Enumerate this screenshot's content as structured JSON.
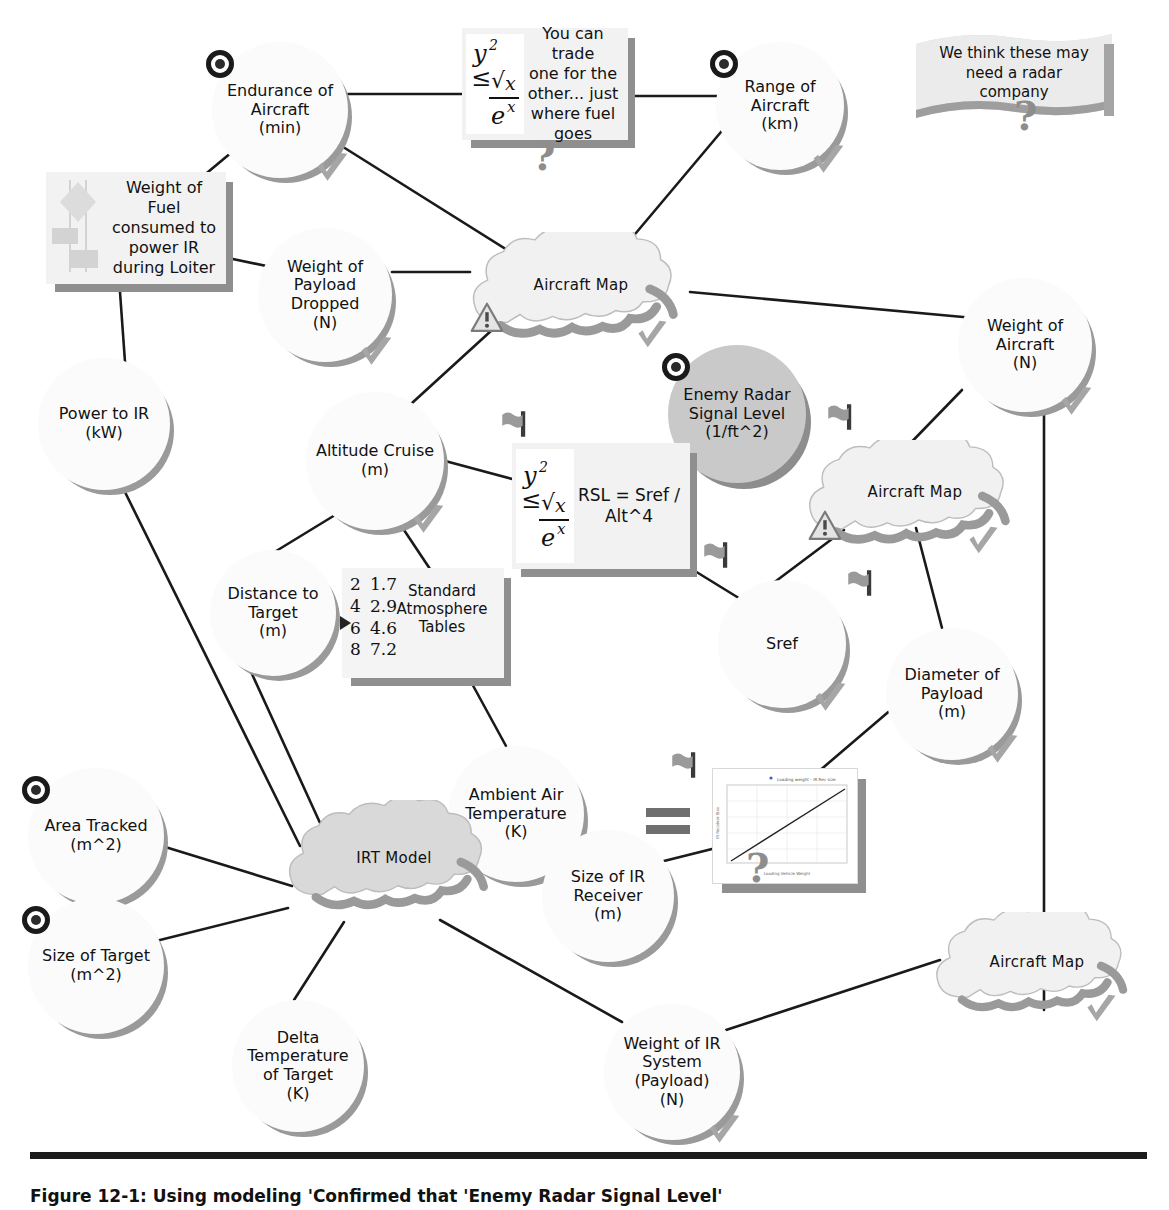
{
  "diagram": {
    "colors": {
      "node_fill": "#fbfbfb",
      "node_shadow": "#9a9a9a",
      "cloud_fill_light": "#f0f0f0",
      "cloud_fill_gray": "#d9d9d9",
      "note_fill": "#f2f2f2",
      "ink": "#111111",
      "edge": "#1a1a1a"
    },
    "nodes": [
      {
        "id": "endurance",
        "label": "Endurance of\nAircraft\n(min)",
        "shape": "circle",
        "x": 212,
        "y": 42,
        "d": 136,
        "font": 16,
        "target": true,
        "check": true
      },
      {
        "id": "range",
        "label": "Range of\nAircraft\n(km)",
        "shape": "circle",
        "x": 716,
        "y": 42,
        "d": 128,
        "font": 16,
        "target": true,
        "check": true
      },
      {
        "id": "payload_dropped",
        "label": "Weight of\nPayload\nDropped\n(N)",
        "shape": "circle",
        "x": 258,
        "y": 228,
        "d": 134,
        "font": 16,
        "target": false,
        "check": true
      },
      {
        "id": "weight_aircraft",
        "label": "Weight of\nAircraft\n(N)",
        "shape": "circle",
        "x": 958,
        "y": 278,
        "d": 134,
        "font": 16,
        "target": false,
        "check": true
      },
      {
        "id": "power_ir",
        "label": "Power to IR\n(kW)",
        "shape": "circle",
        "x": 38,
        "y": 358,
        "d": 132,
        "font": 16,
        "target": false,
        "check": false
      },
      {
        "id": "altitude",
        "label": "Altitude Cruise\n(m)",
        "shape": "circle",
        "x": 306,
        "y": 392,
        "d": 138,
        "font": 16,
        "target": false,
        "check": true
      },
      {
        "id": "enemy_radar",
        "label": "Enemy Radar\nSignal Level\n(1/ft^2)",
        "shape": "circle",
        "x": 668,
        "y": 345,
        "d": 138,
        "font": 16,
        "target": true,
        "check": false,
        "filled": true
      },
      {
        "id": "distance",
        "label": "Distance to\nTarget\n(m)",
        "shape": "circle",
        "x": 210,
        "y": 550,
        "d": 126,
        "font": 16,
        "target": false,
        "check": false
      },
      {
        "id": "sref",
        "label": "Sref",
        "shape": "circle",
        "x": 718,
        "y": 580,
        "d": 128,
        "font": 16,
        "target": false,
        "check": true
      },
      {
        "id": "diam_payload",
        "label": "Diameter of\nPayload\n(m)",
        "shape": "circle",
        "x": 886,
        "y": 628,
        "d": 132,
        "font": 16,
        "target": false,
        "check": true
      },
      {
        "id": "area_tracked",
        "label": "Area Tracked\n(m^2)",
        "shape": "circle",
        "x": 28,
        "y": 768,
        "d": 136,
        "font": 16,
        "target": true,
        "check": false
      },
      {
        "id": "ambient_temp",
        "label": "Ambient Air\nTemperature\n(K)",
        "shape": "circle",
        "x": 448,
        "y": 746,
        "d": 136,
        "font": 16,
        "target": false,
        "check": false
      },
      {
        "id": "size_ir_rcvr",
        "label": "Size of IR\nReceiver\n(m)",
        "shape": "circle",
        "x": 542,
        "y": 830,
        "d": 132,
        "font": 16,
        "target": false,
        "check": false
      },
      {
        "id": "size_target",
        "label": "Size of Target\n(m^2)",
        "shape": "circle",
        "x": 28,
        "y": 898,
        "d": 136,
        "font": 16,
        "target": true,
        "check": false
      },
      {
        "id": "delta_temp",
        "label": "Delta\nTemperature\nof Target\n(K)",
        "shape": "circle",
        "x": 232,
        "y": 1000,
        "d": 132,
        "font": 16,
        "target": false,
        "check": false
      },
      {
        "id": "weight_ir_sys",
        "label": "Weight of IR\nSystem\n(Payload)\n(N)",
        "shape": "circle",
        "x": 604,
        "y": 1004,
        "d": 136,
        "font": 16,
        "target": false,
        "check": true
      }
    ],
    "clouds": [
      {
        "id": "aircraft_map_top",
        "label": "Aircraft Map",
        "x": 452,
        "y": 232,
        "w": 258,
        "h": 110,
        "warn": true,
        "check": true,
        "filled": false
      },
      {
        "id": "aircraft_map_mid",
        "label": "Aircraft Map",
        "x": 790,
        "y": 440,
        "w": 250,
        "h": 108,
        "warn": true,
        "check": true,
        "filled": false
      },
      {
        "id": "irt_model",
        "label": "IRT Model",
        "x": 270,
        "y": 800,
        "w": 248,
        "h": 120,
        "warn": false,
        "check": false,
        "filled": true
      },
      {
        "id": "aircraft_map_bot",
        "label": "Aircraft Map",
        "x": 918,
        "y": 912,
        "w": 238,
        "h": 104,
        "warn": false,
        "check": true,
        "filled": false
      }
    ],
    "notes": [
      {
        "id": "trade_note",
        "text": "You can trade\none for the\nother... just\nwhere fuel\ngoes",
        "x": 462,
        "y": 28,
        "w": 166,
        "h": 112,
        "font": 16,
        "equation_glyph": true,
        "question": true
      },
      {
        "id": "fuel_note",
        "text": "Weight of Fuel\nconsumed to\npower IR\nduring Loiter",
        "x": 46,
        "y": 172,
        "w": 180,
        "h": 112,
        "font": 16,
        "equation_glyph": false,
        "question": false,
        "flow_glyph": true
      },
      {
        "id": "rsl_note",
        "text": "RSL = Sref /\nAlt^4",
        "x": 512,
        "y": 443,
        "w": 178,
        "h": 126,
        "font": 17,
        "equation_glyph": true,
        "question": false
      }
    ],
    "banner": {
      "id": "radar_company_banner",
      "text": "We think these may\nneed a radar\ncompany",
      "x": 908,
      "y": 28,
      "w": 212,
      "h": 108,
      "question": true
    },
    "table_icon": {
      "id": "standard_atmosphere_tables",
      "title": "Standard\nAtmosphere\nTables",
      "rows": [
        [
          "2",
          "1.7"
        ],
        [
          "4",
          "2.9"
        ],
        [
          "6",
          "4.6"
        ],
        [
          "8",
          "7.2"
        ]
      ],
      "x": 342,
      "y": 568,
      "w": 162,
      "h": 110
    },
    "plot_note": {
      "id": "ir_size_plot",
      "x": 712,
      "y": 768,
      "w": 144,
      "h": 114,
      "plot_title": "Loading weight - IR Rec size",
      "xlabel": "Loading Vehicle Weight",
      "ylabel": "IR Receiver Size",
      "equals_sign": true,
      "question": true
    },
    "edges": [
      [
        "endurance",
        "fuel_note"
      ],
      [
        "endurance",
        "trade_note"
      ],
      [
        "endurance",
        "aircraft_map_top"
      ],
      [
        "trade_note",
        "range"
      ],
      [
        "range",
        "aircraft_map_top"
      ],
      [
        "fuel_note",
        "payload_dropped"
      ],
      [
        "fuel_note",
        "power_ir"
      ],
      [
        "payload_dropped",
        "aircraft_map_top"
      ],
      [
        "aircraft_map_top",
        "weight_aircraft"
      ],
      [
        "aircraft_map_top",
        "altitude"
      ],
      [
        "altitude",
        "rsl_note"
      ],
      [
        "altitude",
        "distance"
      ],
      [
        "altitude",
        "table_icon"
      ],
      [
        "rsl_note",
        "enemy_radar"
      ],
      [
        "rsl_note",
        "sref"
      ],
      [
        "weight_aircraft",
        "aircraft_map_mid"
      ],
      [
        "weight_aircraft",
        "weight_ir_sys"
      ],
      [
        "aircraft_map_mid",
        "sref"
      ],
      [
        "aircraft_map_mid",
        "diam_payload"
      ],
      [
        "diam_payload",
        "plot_note"
      ],
      [
        "plot_note",
        "size_ir_rcvr"
      ],
      [
        "power_ir",
        "irt_model"
      ],
      [
        "distance",
        "irt_model"
      ],
      [
        "table_icon",
        "ambient_temp"
      ],
      [
        "area_tracked",
        "irt_model"
      ],
      [
        "ambient_temp",
        "irt_model"
      ],
      [
        "size_target",
        "irt_model"
      ],
      [
        "delta_temp",
        "irt_model"
      ],
      [
        "irt_model",
        "size_ir_rcvr"
      ],
      [
        "irt_model",
        "weight_ir_sys"
      ],
      [
        "weight_ir_sys",
        "aircraft_map_bot"
      ]
    ],
    "caption": "Figure 12-1: Using modeling 'Confirmed that 'Enemy Radar Signal Level'"
  }
}
